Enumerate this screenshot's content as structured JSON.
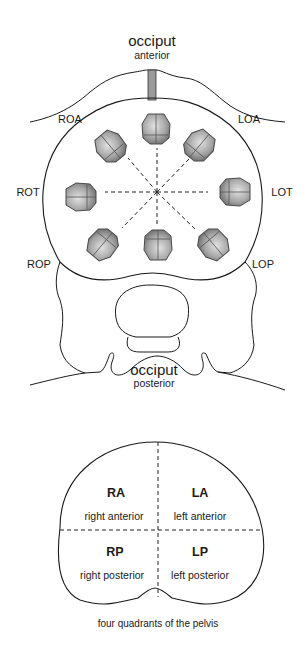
{
  "top_diagram": {
    "title": "occiput",
    "subtitle_top": "anterior",
    "bottom_title": "occiput",
    "subtitle_bottom": "posterior",
    "positions": [
      {
        "id": "ROA",
        "label": "ROA"
      },
      {
        "id": "LOA",
        "label": "LOA"
      },
      {
        "id": "ROT",
        "label": "ROT"
      },
      {
        "id": "LOT",
        "label": "LOT"
      },
      {
        "id": "ROP",
        "label": "ROP"
      },
      {
        "id": "LOP",
        "label": "LOP"
      }
    ],
    "head_color": "#9a9a9a",
    "line_color": "#1a1a1a"
  },
  "quadrant_diagram": {
    "quadrants": [
      {
        "abbr": "RA",
        "label": "right anterior"
      },
      {
        "abbr": "LA",
        "label": "left anterior"
      },
      {
        "abbr": "RP",
        "label": "right posterior"
      },
      {
        "abbr": "LP",
        "label": "left posterior"
      }
    ],
    "caption": "four quadrants of the pelvis"
  }
}
